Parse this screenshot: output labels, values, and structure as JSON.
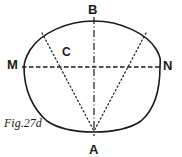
{
  "figure": {
    "caption": "Fig.27d",
    "type": "geometric-construction-oval",
    "canvas": {
      "width": 182,
      "height": 157,
      "background": "#ffffff"
    },
    "stroke_color": "#1a1a1a",
    "labels": {
      "top": "B",
      "left": "M",
      "right": "N",
      "center": "C",
      "bottom": "A"
    },
    "points": {
      "B": {
        "x": 94,
        "y": 21,
        "description": "top of oval on vertical axis"
      },
      "M": {
        "x": 24,
        "y": 67,
        "description": "left end of horizontal chord"
      },
      "N": {
        "x": 160,
        "y": 67,
        "description": "right end of horizontal chord"
      },
      "C": {
        "x": 70,
        "y": 67,
        "description": "marked point on chord MN left of centre"
      },
      "A": {
        "x": 94,
        "y": 132,
        "description": "bottom of oval on vertical axis"
      },
      "P_left": {
        "x": 42,
        "y": 33,
        "description": "upper-left point on oval"
      },
      "P_right": {
        "x": 146,
        "y": 33,
        "description": "upper-right point on oval"
      }
    },
    "lines": [
      {
        "name": "vertical-axis-BA",
        "from": "B",
        "to": "A",
        "style": "dash-dot"
      },
      {
        "name": "horizontal-axis-MN",
        "from": "M",
        "to": "N",
        "style": "dashed"
      },
      {
        "name": "construction-line-left",
        "from": "P_left",
        "to": "A",
        "style": "dotted"
      },
      {
        "name": "construction-line-right",
        "from": "P_right",
        "to": "A",
        "style": "dotted"
      }
    ],
    "outline": {
      "name": "oval-outline",
      "style": "solid",
      "description": "closed egg-shaped oval, flatter across the top, rounder and fuller at the bottom"
    }
  }
}
